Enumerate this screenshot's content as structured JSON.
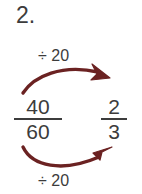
{
  "problem": {
    "number_label": "2."
  },
  "equation": {
    "left_fraction": {
      "numerator": "40",
      "denominator": "60"
    },
    "right_fraction": {
      "numerator": "2",
      "denominator": "3"
    }
  },
  "operations": {
    "top_label": "÷ 20",
    "bottom_label": "÷ 20"
  },
  "colors": {
    "arrow": "#6b2222",
    "text": "#3c3c3c",
    "background": "#ffffff"
  },
  "icons": {
    "top_arrow": "curved-arrow-right-icon",
    "bottom_arrow": "curved-arrow-right-icon"
  }
}
